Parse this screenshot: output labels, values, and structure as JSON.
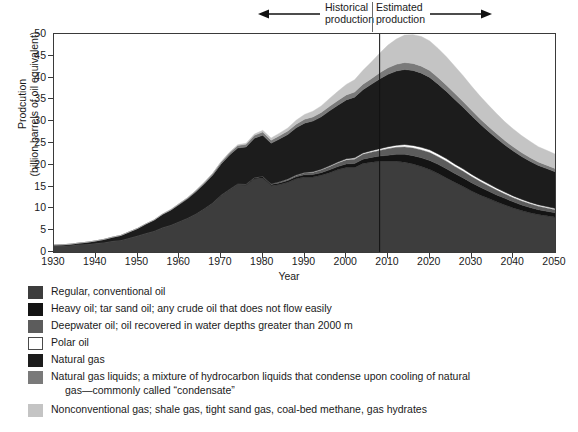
{
  "annotations": {
    "historical": {
      "line1": "Historical",
      "line2": "production",
      "arrow": "left-arrow-icon"
    },
    "estimated": {
      "line1": "Estimated",
      "line2": "production",
      "arrow": "right-arrow-icon"
    },
    "divider_year": 2008
  },
  "chart_data": {
    "type": "area",
    "title": "",
    "xlabel": "Year",
    "ylabel_line1": "Prodcution",
    "ylabel_line2": "(billion barrels of oil equivalent)",
    "xlim": [
      1930,
      2050
    ],
    "ylim": [
      0,
      50
    ],
    "ytick_values": [
      0,
      5,
      10,
      15,
      20,
      25,
      30,
      35,
      40,
      45,
      50
    ],
    "xtick_values": [
      1930,
      1940,
      1950,
      1960,
      1970,
      1980,
      1990,
      2000,
      2010,
      2020,
      2030,
      2040,
      2050
    ],
    "grid": false,
    "legend_position": "below",
    "stacked": true,
    "x": [
      1930,
      1932,
      1934,
      1936,
      1938,
      1940,
      1942,
      1944,
      1946,
      1948,
      1950,
      1952,
      1954,
      1956,
      1958,
      1960,
      1962,
      1964,
      1966,
      1968,
      1970,
      1972,
      1974,
      1976,
      1978,
      1980,
      1982,
      1984,
      1986,
      1988,
      1990,
      1992,
      1994,
      1996,
      1998,
      2000,
      2002,
      2004,
      2006,
      2008,
      2010,
      2012,
      2014,
      2016,
      2018,
      2020,
      2022,
      2024,
      2026,
      2028,
      2030,
      2032,
      2034,
      2036,
      2038,
      2040,
      2042,
      2044,
      2046,
      2048,
      2050
    ],
    "series": [
      {
        "name": "Regular, conventional oil",
        "color": "#3d3d3d",
        "values": [
          1.4,
          1.4,
          1.5,
          1.7,
          1.8,
          2.0,
          2.2,
          2.5,
          2.7,
          3.2,
          3.7,
          4.3,
          4.8,
          5.6,
          6.2,
          7.0,
          7.8,
          8.8,
          10.0,
          11.3,
          13.0,
          14.3,
          15.5,
          15.4,
          16.8,
          17.0,
          15.2,
          15.5,
          16.0,
          16.8,
          17.2,
          17.2,
          17.6,
          18.2,
          18.9,
          19.4,
          19.4,
          20.3,
          20.6,
          20.8,
          20.8,
          20.8,
          20.6,
          20.2,
          19.6,
          18.9,
          18.0,
          17.0,
          16.0,
          15.0,
          14.0,
          13.1,
          12.3,
          11.5,
          10.8,
          10.1,
          9.5,
          9.0,
          8.6,
          8.3,
          8.0
        ]
      },
      {
        "name": "Heavy oil; tar sand oil; any crude oil that does not flow easily",
        "color": "#141414",
        "values": [
          0.0,
          0.0,
          0.0,
          0.0,
          0.0,
          0.0,
          0.0,
          0.0,
          0.0,
          0.0,
          0.0,
          0.0,
          0.0,
          0.0,
          0.0,
          0.0,
          0.0,
          0.0,
          0.0,
          0.0,
          0.05,
          0.1,
          0.15,
          0.2,
          0.25,
          0.3,
          0.3,
          0.35,
          0.4,
          0.45,
          0.5,
          0.55,
          0.6,
          0.65,
          0.7,
          0.8,
          0.9,
          1.0,
          1.1,
          1.2,
          1.4,
          1.6,
          1.8,
          1.9,
          2.0,
          2.1,
          2.1,
          2.1,
          2.0,
          2.0,
          1.9,
          1.8,
          1.7,
          1.6,
          1.5,
          1.4,
          1.3,
          1.2,
          1.1,
          1.05,
          1.0
        ]
      },
      {
        "name": "Deepwater oil; oil recovered in water depths greater than 2000 m",
        "color": "#5c5c5c",
        "values": [
          0.0,
          0.0,
          0.0,
          0.0,
          0.0,
          0.0,
          0.0,
          0.0,
          0.0,
          0.0,
          0.0,
          0.0,
          0.0,
          0.0,
          0.0,
          0.0,
          0.0,
          0.0,
          0.0,
          0.0,
          0.0,
          0.0,
          0.0,
          0.0,
          0.05,
          0.1,
          0.15,
          0.2,
          0.25,
          0.3,
          0.4,
          0.5,
          0.6,
          0.7,
          0.8,
          0.9,
          1.0,
          1.1,
          1.2,
          1.3,
          1.5,
          1.6,
          1.7,
          1.75,
          1.8,
          1.8,
          1.75,
          1.7,
          1.6,
          1.5,
          1.4,
          1.3,
          1.2,
          1.1,
          1.0,
          0.95,
          0.9,
          0.85,
          0.8,
          0.75,
          0.7
        ]
      },
      {
        "name": "Polar oil",
        "color": "#ffffff",
        "values": [
          0.0,
          0.0,
          0.0,
          0.0,
          0.0,
          0.0,
          0.0,
          0.0,
          0.0,
          0.0,
          0.0,
          0.0,
          0.0,
          0.0,
          0.0,
          0.0,
          0.0,
          0.0,
          0.0,
          0.0,
          0.0,
          0.0,
          0.0,
          0.0,
          0.0,
          0.0,
          0.0,
          0.05,
          0.1,
          0.12,
          0.15,
          0.18,
          0.2,
          0.22,
          0.25,
          0.28,
          0.3,
          0.32,
          0.35,
          0.4,
          0.45,
          0.5,
          0.55,
          0.6,
          0.62,
          0.65,
          0.65,
          0.62,
          0.6,
          0.58,
          0.55,
          0.52,
          0.5,
          0.47,
          0.45,
          0.42,
          0.4,
          0.38,
          0.36,
          0.34,
          0.32
        ]
      },
      {
        "name": "Natural gas",
        "color": "#1c1c1c",
        "values": [
          0.2,
          0.25,
          0.3,
          0.35,
          0.45,
          0.55,
          0.7,
          0.9,
          1.1,
          1.4,
          1.7,
          2.1,
          2.5,
          3.0,
          3.4,
          3.9,
          4.4,
          5.0,
          5.6,
          6.3,
          7.1,
          7.8,
          8.2,
          8.5,
          9.0,
          9.4,
          9.3,
          9.8,
          10.2,
          10.8,
          11.3,
          11.6,
          12.0,
          12.6,
          13.0,
          13.5,
          13.9,
          14.5,
          15.2,
          16.0,
          16.6,
          17.0,
          17.2,
          17.2,
          17.0,
          16.6,
          16.0,
          15.4,
          14.8,
          14.1,
          13.4,
          12.7,
          12.0,
          11.4,
          10.8,
          10.3,
          9.8,
          9.4,
          9.0,
          8.7,
          8.4
        ]
      },
      {
        "name": "Natural gas liquids; a mixture of hydrocarbon liquids that condense upon cooling of natural gas—commonly called “condensate”",
        "color": "#7a7a7a",
        "values": [
          0.0,
          0.0,
          0.0,
          0.0,
          0.0,
          0.0,
          0.0,
          0.0,
          0.0,
          0.0,
          0.0,
          0.05,
          0.1,
          0.12,
          0.15,
          0.2,
          0.25,
          0.3,
          0.35,
          0.4,
          0.45,
          0.5,
          0.55,
          0.6,
          0.65,
          0.7,
          0.7,
          0.75,
          0.8,
          0.85,
          0.9,
          0.95,
          1.0,
          1.05,
          1.1,
          1.15,
          1.2,
          1.25,
          1.3,
          1.4,
          1.5,
          1.55,
          1.6,
          1.6,
          1.6,
          1.55,
          1.5,
          1.45,
          1.4,
          1.35,
          1.3,
          1.2,
          1.15,
          1.1,
          1.0,
          0.95,
          0.9,
          0.85,
          0.8,
          0.78,
          0.75
        ]
      },
      {
        "name": "Nonconventional gas; shale gas, tight sand gas, coal-bed methane, gas hydrates",
        "color": "#c4c4c4",
        "values": [
          0.0,
          0.0,
          0.0,
          0.0,
          0.0,
          0.0,
          0.0,
          0.0,
          0.0,
          0.0,
          0.0,
          0.0,
          0.0,
          0.0,
          0.0,
          0.0,
          0.0,
          0.0,
          0.0,
          0.0,
          0.1,
          0.15,
          0.2,
          0.25,
          0.3,
          0.4,
          0.5,
          0.6,
          0.7,
          0.9,
          1.1,
          1.3,
          1.5,
          1.8,
          2.1,
          2.4,
          2.8,
          3.2,
          3.8,
          4.5,
          5.2,
          5.8,
          6.3,
          6.6,
          6.8,
          6.8,
          6.7,
          6.5,
          6.2,
          5.9,
          5.5,
          5.2,
          4.9,
          4.6,
          4.3,
          4.1,
          3.9,
          3.7,
          3.5,
          3.4,
          3.3
        ]
      }
    ]
  },
  "legend": {
    "items": [
      {
        "label": "Regular, conventional oil",
        "color": "#3d3d3d",
        "cont": ""
      },
      {
        "label": "Heavy oil; tar sand oil; any crude oil that does not flow easily",
        "color": "#141414",
        "cont": ""
      },
      {
        "label": "Deepwater oil; oil recovered in water depths greater than 2000 m",
        "color": "#5c5c5c",
        "cont": ""
      },
      {
        "label": "Polar oil",
        "color": "#ffffff",
        "cont": ""
      },
      {
        "label": "Natural gas",
        "color": "#1c1c1c",
        "cont": ""
      },
      {
        "label": "Natural gas liquids; a mixture of hydrocarbon liquids that condense upon cooling of natural",
        "color": "#7a7a7a",
        "cont": "gas—commonly called “condensate”"
      },
      {
        "label": "Nonconventional gas; shale gas, tight sand gas, coal-bed methane, gas hydrates",
        "color": "#c4c4c4",
        "cont": ""
      }
    ]
  }
}
